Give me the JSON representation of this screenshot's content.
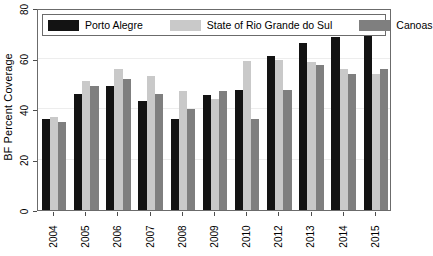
{
  "chart_data": {
    "type": "bar",
    "title": "",
    "xlabel": "",
    "ylabel": "BF Percent Coverage",
    "ylim": [
      0,
      80
    ],
    "yticks": [
      0,
      20,
      40,
      60,
      80
    ],
    "grid": true,
    "legend_position": "top-inside",
    "categories": [
      "2004",
      "2005",
      "2006",
      "2007",
      "2008",
      "2009",
      "2010",
      "2012",
      "2013",
      "2014",
      "2015"
    ],
    "series": [
      {
        "name": "Porto Alegre",
        "color": "#131313",
        "values": [
          36,
          46,
          49,
          43,
          36,
          45.5,
          47.5,
          61,
          66,
          68.5,
          71.5
        ]
      },
      {
        "name": "State of Rio Grande do Sul",
        "color": "#c9c9c9",
        "values": [
          37,
          51,
          56,
          53,
          47,
          44,
          59,
          59.5,
          58.5,
          56,
          54
        ]
      },
      {
        "name": "Canoas",
        "color": "#7f7f7f",
        "values": [
          35,
          49,
          52,
          46,
          40,
          47,
          36,
          47.5,
          57.5,
          54,
          56
        ]
      }
    ]
  },
  "legend": {
    "items": [
      {
        "label": "Porto Alegre",
        "color": "#131313"
      },
      {
        "label": "State of Rio Grande do Sul",
        "color": "#c9c9c9"
      },
      {
        "label": "Canoas",
        "color": "#7f7f7f"
      }
    ]
  },
  "axes": {
    "y_title": "BF Percent Coverage",
    "y_ticks": [
      "0",
      "20",
      "40",
      "60",
      "80"
    ],
    "x_ticks": [
      "2004",
      "2005",
      "2006",
      "2007",
      "2008",
      "2009",
      "2010",
      "2012",
      "2013",
      "2014",
      "2015"
    ]
  }
}
